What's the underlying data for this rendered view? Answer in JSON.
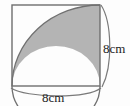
{
  "figure": {
    "type": "geometry-diagram",
    "background_color": "#fdfdfd",
    "shaded_fill_color": "#b4b4b4",
    "outline_color": "#6b6b6b",
    "label_color": "#222222",
    "square": {
      "side_label": "8cm",
      "left": 12,
      "top": 5,
      "right": 100,
      "bottom": 86
    },
    "labels": {
      "right_dimension": "8cm",
      "bottom_dimension": "8cm"
    },
    "shapes": [
      {
        "name": "square-outline"
      },
      {
        "name": "quarter-circle-arc"
      },
      {
        "name": "semicircle-arc"
      },
      {
        "name": "shaded-lune-region"
      },
      {
        "name": "right-dimension-brace"
      },
      {
        "name": "bottom-dimension-brace"
      }
    ]
  }
}
